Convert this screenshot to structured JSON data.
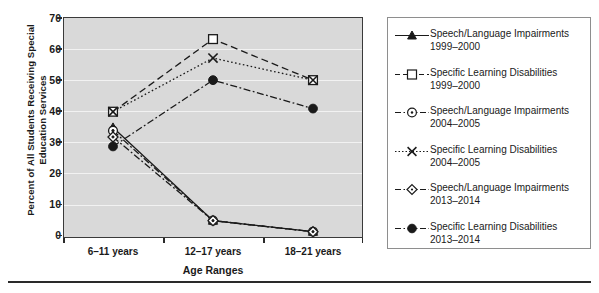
{
  "chart_data": {
    "type": "line",
    "title": "",
    "xlabel": "Age Ranges",
    "ylabel": "Percent of All Students Receiving Special Education Services",
    "categories": [
      "6–11 years",
      "12–17 years",
      "18–21 years"
    ],
    "ylim": [
      0,
      70
    ],
    "yticks": [
      0,
      10,
      20,
      30,
      40,
      50,
      60,
      70
    ],
    "grid": true,
    "legend_position": "right",
    "series": [
      {
        "name": "Speech/Language Impairments 1999–2000",
        "label_line1": "Speech/Language Impairments",
        "label_line2": "1999–2000",
        "marker": "filled-triangle",
        "linestyle": "solid",
        "values": [
          35,
          5.5,
          2
        ]
      },
      {
        "name": "Specific Learning Disabilities 1999–2000",
        "label_line1": "Specific Learning Disabilities",
        "label_line2": "1999–2000",
        "marker": "open-square",
        "linestyle": "dashed",
        "values": [
          40,
          63,
          50
        ]
      },
      {
        "name": "Speech/Language Impairments 2004–2005",
        "label_line1": "Speech/Language Impairments",
        "label_line2": "2004–2005",
        "marker": "open-circle-dot",
        "linestyle": "dash-dot",
        "values": [
          34,
          5.5,
          2
        ]
      },
      {
        "name": "Specific Learning Disabilities 2004–2005",
        "label_line1": "Specific Learning Disabilities",
        "label_line2": "2004–2005",
        "marker": "cross-x",
        "linestyle": "dotted",
        "values": [
          40,
          57,
          50
        ]
      },
      {
        "name": "Speech/Language Impairments 2013–2014",
        "label_line1": "Speech/Language Impairments",
        "label_line2": "2013–2014",
        "marker": "open-diamond",
        "linestyle": "dash-dot",
        "values": [
          32,
          5.5,
          2
        ]
      },
      {
        "name": "Specific Learning Disabilities 2013–2014",
        "label_line1": "Specific Learning Disabilities",
        "label_line2": "2013–2014",
        "marker": "filled-circle",
        "linestyle": "dash-dot",
        "values": [
          29,
          50,
          41
        ]
      }
    ],
    "colors": {
      "plot_background": "#d9d9d9",
      "gridline": "#f2f2f2",
      "axis": "#3a3a3a",
      "series": "#1a1a1a",
      "legend_background": "#ffffff",
      "legend_border": "#8e8e8e"
    }
  },
  "yticks": {
    "t0": "0",
    "t1": "10",
    "t2": "20",
    "t3": "30",
    "t4": "40",
    "t5": "50",
    "t6": "60",
    "t7": "70"
  },
  "xticks": {
    "c0": "6–11 years",
    "c1": "12–17 years",
    "c2": "18–21 years"
  },
  "axes": {
    "x_title": "Age Ranges",
    "y_title": "Percent of All Students Receiving\nSpecial Education Services"
  },
  "legend": {
    "e0_l1": "Speech/Language Impairments",
    "e0_l2": "1999–2000",
    "e1_l1": "Specific Learning Disabilities",
    "e1_l2": "1999–2000",
    "e2_l1": "Speech/Language Impairments",
    "e2_l2": "2004–2005",
    "e3_l1": "Specific Learning Disabilities",
    "e3_l2": "2004–2005",
    "e4_l1": "Speech/Language Impairments",
    "e4_l2": "2013–2014",
    "e5_l1": "Specific Learning Disabilities",
    "e5_l2": "2013–2014"
  }
}
